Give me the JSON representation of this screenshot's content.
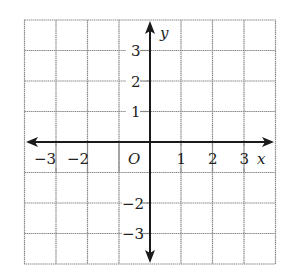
{
  "diagram": {
    "type": "coordinate-plane",
    "x_axis": {
      "label": "x",
      "ticks": [
        "-3",
        "-2",
        "1",
        "2",
        "3"
      ],
      "range": [
        -4,
        4
      ]
    },
    "y_axis": {
      "label": "y",
      "ticks": [
        "3",
        "2",
        "1",
        "-2",
        "-3"
      ],
      "range": [
        -4,
        4
      ]
    },
    "origin_label": "O",
    "grid": {
      "columns": 8,
      "rows": 8
    }
  },
  "labels": {
    "x": "x",
    "y": "y",
    "origin": "O",
    "xm3": "−3",
    "xm2": "−2",
    "x1": "1",
    "x2": "2",
    "x3": "3",
    "y3": "3",
    "y2": "2",
    "y1": "1",
    "ym2": "−2",
    "ym3": "−3"
  },
  "colors": {
    "grid": "#7a7a7a",
    "axis": "#1a1a1a",
    "text": "#222222"
  }
}
